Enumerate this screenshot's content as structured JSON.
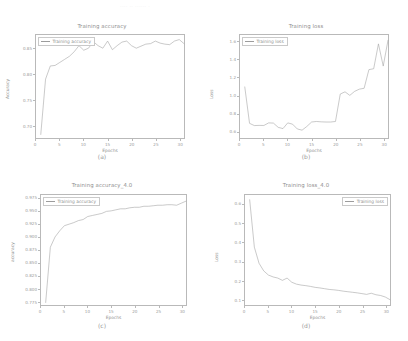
{
  "figure": {
    "background": "#ffffff",
    "line_color": "#9c9c9c",
    "axis_color": "#b9b9b9",
    "text_color": "#8f8f8f",
    "ghost_header": "....  ..  ......  ."
  },
  "panels": [
    {
      "caption": "(a)",
      "legend_position": "upper-left",
      "chart_data": {
        "type": "line",
        "title": "Training accuracy",
        "xlabel": "Epochs",
        "ylabel": "Accuracy",
        "xlim": [
          0,
          31
        ],
        "ylim": [
          0.675,
          0.878
        ],
        "xticks": [
          0,
          5,
          10,
          15,
          20,
          25,
          30
        ],
        "xtick_labels": [
          "0",
          "5",
          "10",
          "15",
          "20",
          "25",
          "30"
        ],
        "yticks": [
          0.7,
          0.75,
          0.8,
          0.85
        ],
        "ytick_labels": [
          "0.70",
          "0.75",
          "0.80",
          "0.85"
        ],
        "grid": false,
        "legend": [
          "Training accuracy"
        ],
        "series": [
          {
            "name": "Training accuracy",
            "x": [
              1,
              2,
              3,
              4,
              5,
              6,
              7,
              8,
              9,
              10,
              11,
              12,
              13,
              14,
              15,
              16,
              17,
              18,
              19,
              20,
              21,
              22,
              23,
              24,
              25,
              26,
              27,
              28,
              29,
              30,
              31
            ],
            "values": [
              0.682,
              0.791,
              0.817,
              0.818,
              0.824,
              0.83,
              0.836,
              0.845,
              0.857,
              0.848,
              0.852,
              0.865,
              0.857,
              0.852,
              0.866,
              0.849,
              0.857,
              0.864,
              0.866,
              0.857,
              0.852,
              0.856,
              0.86,
              0.861,
              0.866,
              0.862,
              0.86,
              0.859,
              0.866,
              0.869,
              0.861
            ]
          }
        ]
      }
    },
    {
      "caption": "(b)",
      "legend_position": "upper-left",
      "chart_data": {
        "type": "line",
        "title": "Training loss",
        "xlabel": "Epochs",
        "ylabel": "Loss",
        "xlim": [
          0,
          31
        ],
        "ylim": [
          0.52,
          1.68
        ],
        "xticks": [
          0,
          5,
          10,
          15,
          20,
          25,
          30
        ],
        "xtick_labels": [
          "0",
          "5",
          "10",
          "15",
          "20",
          "25",
          "30"
        ],
        "yticks": [
          0.6,
          0.8,
          1.0,
          1.2,
          1.4,
          1.6
        ],
        "ytick_labels": [
          "0.6",
          "0.8",
          "1.0",
          "1.2",
          "1.4",
          "1.6"
        ],
        "grid": false,
        "legend": [
          "Training loss"
        ],
        "series": [
          {
            "name": "Training loss",
            "x": [
              1,
              2,
              3,
              4,
              5,
              6,
              7,
              8,
              9,
              10,
              11,
              12,
              13,
              14,
              15,
              16,
              17,
              18,
              19,
              20,
              21,
              22,
              23,
              24,
              25,
              26,
              27,
              28,
              29,
              30,
              31
            ],
            "values": [
              1.095,
              0.685,
              0.66,
              0.662,
              0.661,
              0.69,
              0.688,
              0.64,
              0.626,
              0.69,
              0.676,
              0.622,
              0.608,
              0.65,
              0.7,
              0.706,
              0.702,
              0.7,
              0.7,
              0.706,
              1.015,
              1.04,
              1.0,
              1.045,
              1.07,
              1.08,
              1.29,
              1.3,
              1.58,
              1.33,
              1.62
            ]
          }
        ]
      }
    },
    {
      "caption": "(c)",
      "legend_position": "upper-left",
      "chart_data": {
        "type": "line",
        "title": "Training accuracy_4.0",
        "xlabel": "Epochs",
        "ylabel": "accuracy",
        "xlim": [
          0,
          31
        ],
        "ylim": [
          0.767,
          0.982
        ],
        "xticks": [
          0,
          5,
          10,
          15,
          20,
          25,
          30
        ],
        "xtick_labels": [
          "0",
          "5",
          "10",
          "15",
          "20",
          "25",
          "30"
        ],
        "yticks": [
          0.775,
          0.8,
          0.825,
          0.85,
          0.875,
          0.9,
          0.925,
          0.95,
          0.975
        ],
        "ytick_labels": [
          "0.775",
          "0.800",
          "0.825",
          "0.850",
          "0.875",
          "0.900",
          "0.925",
          "0.950",
          "0.975"
        ],
        "grid": false,
        "legend": [
          "Training accuracy"
        ],
        "series": [
          {
            "name": "Training accuracy",
            "x": [
              1,
              2,
              3,
              4,
              5,
              6,
              7,
              8,
              9,
              10,
              11,
              12,
              13,
              14,
              15,
              16,
              17,
              18,
              19,
              20,
              21,
              22,
              23,
              24,
              25,
              26,
              27,
              28,
              29,
              30,
              31
            ],
            "values": [
              0.772,
              0.88,
              0.9,
              0.912,
              0.922,
              0.925,
              0.928,
              0.932,
              0.934,
              0.94,
              0.942,
              0.944,
              0.946,
              0.95,
              0.951,
              0.953,
              0.955,
              0.955,
              0.957,
              0.958,
              0.958,
              0.96,
              0.96,
              0.961,
              0.962,
              0.962,
              0.963,
              0.963,
              0.962,
              0.966,
              0.97
            ]
          }
        ]
      }
    },
    {
      "caption": "(d)",
      "legend_position": "upper-right",
      "chart_data": {
        "type": "line",
        "title": "Training loss_4.0",
        "xlabel": "Epochs",
        "ylabel": "Loss",
        "xlim": [
          0,
          31
        ],
        "ylim": [
          0.07,
          0.65
        ],
        "xticks": [
          0,
          5,
          10,
          15,
          20,
          25,
          30
        ],
        "xtick_labels": [
          "0",
          "5",
          "10",
          "15",
          "20",
          "25",
          "30"
        ],
        "yticks": [
          0.1,
          0.2,
          0.3,
          0.4,
          0.5,
          0.6
        ],
        "ytick_labels": [
          "0.1",
          "0.2",
          "0.3",
          "0.4",
          "0.5",
          "0.6"
        ],
        "grid": false,
        "legend": [
          "Training loss"
        ],
        "series": [
          {
            "name": "Training loss",
            "x": [
              1,
              2,
              3,
              4,
              5,
              6,
              7,
              8,
              9,
              10,
              11,
              12,
              13,
              14,
              15,
              16,
              17,
              18,
              19,
              20,
              21,
              22,
              23,
              24,
              25,
              26,
              27,
              28,
              29,
              30,
              31
            ],
            "values": [
              0.625,
              0.375,
              0.29,
              0.25,
              0.228,
              0.218,
              0.212,
              0.2,
              0.212,
              0.19,
              0.18,
              0.175,
              0.172,
              0.168,
              0.163,
              0.16,
              0.156,
              0.152,
              0.15,
              0.147,
              0.143,
              0.14,
              0.137,
              0.134,
              0.13,
              0.126,
              0.132,
              0.124,
              0.12,
              0.112,
              0.098
            ]
          }
        ]
      }
    }
  ]
}
